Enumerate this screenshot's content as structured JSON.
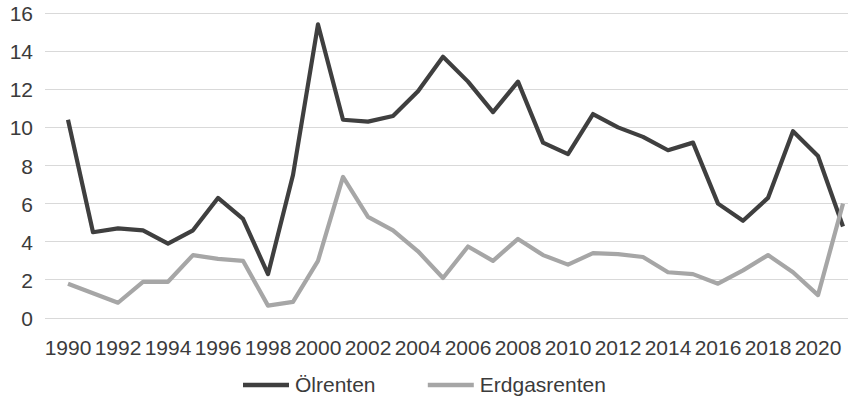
{
  "chart_data": {
    "type": "line",
    "title": "",
    "xlabel": "",
    "ylabel": "",
    "ylim": [
      0,
      16
    ],
    "ytick_labels": [
      "0",
      "2",
      "4",
      "6",
      "8",
      "10",
      "12",
      "14",
      "16"
    ],
    "yticks": [
      0,
      2,
      4,
      6,
      8,
      10,
      12,
      14,
      16
    ],
    "xlim": [
      1990,
      2021
    ],
    "xtick_labels": [
      "1990",
      "1992",
      "1994",
      "1996",
      "1998",
      "2000",
      "2002",
      "2004",
      "2006",
      "2008",
      "2010",
      "2012",
      "2014",
      "2016",
      "2018",
      "2020"
    ],
    "xticks": [
      1990,
      1992,
      1994,
      1996,
      1998,
      2000,
      2002,
      2004,
      2006,
      2008,
      2010,
      2012,
      2014,
      2016,
      2018,
      2020
    ],
    "grid": true,
    "legend_position": "bottom",
    "x": [
      1990,
      1991,
      1992,
      1993,
      1994,
      1995,
      1996,
      1997,
      1998,
      1999,
      2000,
      2001,
      2002,
      2003,
      2004,
      2005,
      2006,
      2007,
      2008,
      2009,
      2010,
      2011,
      2012,
      2013,
      2014,
      2015,
      2016,
      2017,
      2018,
      2019,
      2020,
      2021
    ],
    "series": [
      {
        "name": "Ölrenten",
        "color": "#3f3f3f",
        "values": [
          10.4,
          4.5,
          4.7,
          4.6,
          3.9,
          4.6,
          6.3,
          5.2,
          2.3,
          7.5,
          15.4,
          10.4,
          10.3,
          10.6,
          11.9,
          13.7,
          12.4,
          10.8,
          12.4,
          9.2,
          8.6,
          10.7,
          10.0,
          9.5,
          8.8,
          9.2,
          6.0,
          5.1,
          6.3,
          9.8,
          8.5,
          4.8
        ]
      },
      {
        "name": "Erdgasrenten",
        "color": "#a6a6a6",
        "values": [
          1.8,
          1.3,
          0.8,
          1.9,
          1.9,
          3.3,
          3.1,
          3.0,
          0.65,
          0.85,
          3.0,
          7.4,
          5.3,
          4.6,
          3.5,
          2.1,
          3.75,
          3.0,
          4.15,
          3.3,
          2.8,
          3.4,
          3.35,
          3.2,
          2.4,
          2.3,
          1.8,
          2.5,
          3.3,
          2.4,
          1.2,
          6.0
        ]
      }
    ]
  },
  "legend": {
    "items": [
      {
        "label": "Ölrenten",
        "color": "#3f3f3f"
      },
      {
        "label": "Erdgasrenten",
        "color": "#a6a6a6"
      }
    ]
  }
}
